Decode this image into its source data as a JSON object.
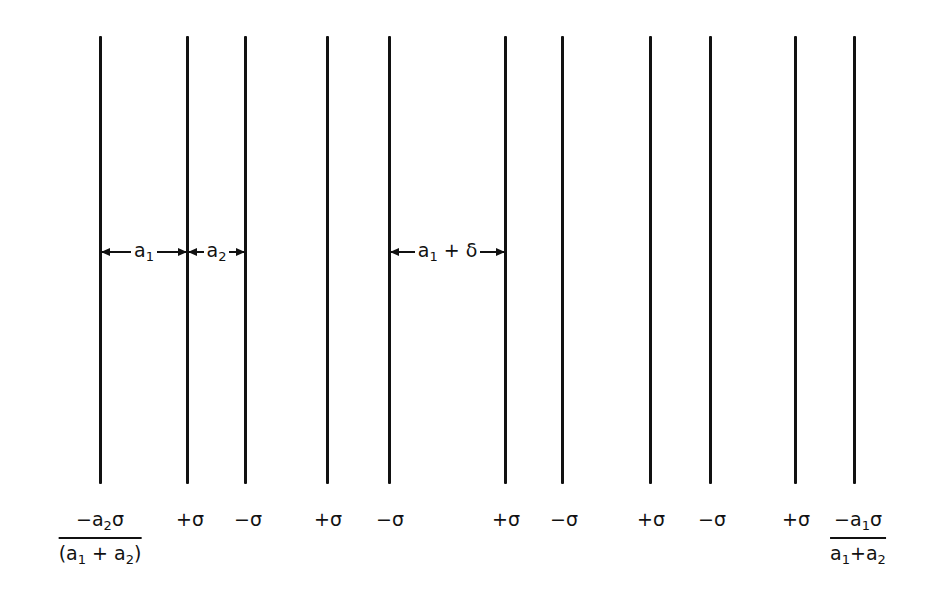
{
  "diagram": {
    "lines_x": [
      100,
      187,
      245,
      327,
      389,
      505,
      562,
      650,
      710,
      795,
      854
    ],
    "line_top": 36,
    "line_bottom": 483,
    "dimensions": [
      {
        "from": 100,
        "to": 187,
        "label_main": "a",
        "label_sub": "1"
      },
      {
        "from": 187,
        "to": 245,
        "label_main": "a",
        "label_sub": "2"
      },
      {
        "from": 389,
        "to": 505,
        "label_main": "a",
        "label_sub": "1",
        "label_suffix": "+ δ"
      }
    ],
    "labels": [
      {
        "x": 100,
        "type": "fraction",
        "num_pre": "−a",
        "num_sub": "2",
        "num_post": "σ",
        "den_pre": "(a",
        "den_sub1": "1",
        "den_mid": " + a",
        "den_sub2": "2",
        "den_post": ")"
      },
      {
        "x": 187,
        "text": "+σ"
      },
      {
        "x": 245,
        "text": "−σ"
      },
      {
        "x": 327,
        "text": "+σ"
      },
      {
        "x": 389,
        "text": "−σ"
      },
      {
        "x": 505,
        "text": "+σ"
      },
      {
        "x": 562,
        "text": "−σ"
      },
      {
        "x": 650,
        "text": "+σ"
      },
      {
        "x": 710,
        "text": "−σ"
      },
      {
        "x": 795,
        "text": "+σ"
      },
      {
        "x": 854,
        "type": "fraction",
        "num_pre": "−a",
        "num_sub": "1",
        "num_post": "σ",
        "den_pre": "a",
        "den_sub1": "1",
        "den_mid": "+a",
        "den_sub2": "2",
        "den_post": ""
      }
    ]
  }
}
